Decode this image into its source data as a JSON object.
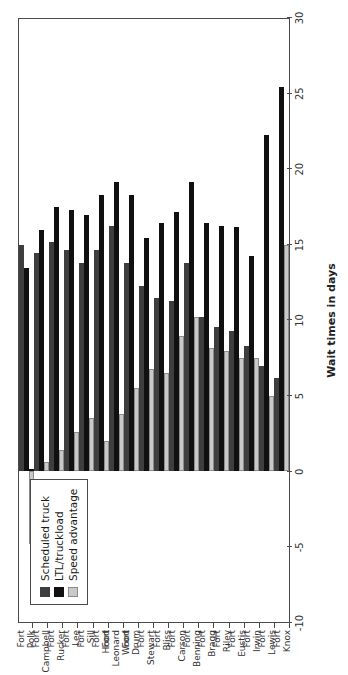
{
  "chart_data": {
    "type": "bar",
    "orientation": "horizontal-grouped",
    "title": "",
    "xlabel": "Wait times in days",
    "ylabel": "",
    "grid": false,
    "legend_position": "top-left-inside",
    "xlim": [
      -10,
      30
    ],
    "xticks": [
      -10,
      -5,
      0,
      5,
      10,
      15,
      20,
      25,
      30
    ],
    "xtick_labels": [
      "-10",
      "-5",
      "0",
      "5",
      "10",
      "15",
      "20",
      "25",
      "30"
    ],
    "categories": [
      "Fort\nKnox",
      "Fort\nLewis",
      "Fort\nIrwin",
      "Fort\nEustis",
      "Fort\nRiley",
      "Fort\nBragg",
      "Fort\nBenning",
      "Fort\nCarson",
      "Fort\nBliss",
      "Fort\nStewart",
      "Fort\nDrum",
      "Fort\nLeonard\nWood",
      "Fort\nHood",
      "Fort\nSill",
      "Fort\nLee",
      "Fort\nRucker",
      "Fort\nCampbell",
      "Fort\nPolk"
    ],
    "series": [
      {
        "name": "Scheduled truck",
        "color": "#3e3e3e",
        "values": [
          6.2,
          7.0,
          8.3,
          9.3,
          9.6,
          10.2,
          13.8,
          11.3,
          11.5,
          12.3,
          13.8,
          16.3,
          14.7,
          13.8,
          14.7,
          15.2,
          14.5,
          15.0
        ]
      },
      {
        "name": "LTL/truckload",
        "color": "#101010",
        "values": [
          25.5,
          22.3,
          14.3,
          16.2,
          16.3,
          16.5,
          19.2,
          17.2,
          16.5,
          15.5,
          18.3,
          19.2,
          18.3,
          17.0,
          17.3,
          17.5,
          16.0,
          13.5
        ]
      },
      {
        "name": "Speed advantage",
        "color": "#c9c9c9",
        "values": [
          15.0,
          5.0,
          7.5,
          7.5,
          8.0,
          8.2,
          10.2,
          9.0,
          6.5,
          6.8,
          5.5,
          3.8,
          2.0,
          3.5,
          2.6,
          1.4,
          0.6,
          -4.8
        ]
      }
    ]
  },
  "legend": {
    "items": [
      {
        "label": "Scheduled truck"
      },
      {
        "label": "LTL/truckload"
      },
      {
        "label": "Speed advantage"
      }
    ]
  },
  "axis": {
    "value_title": "Wait times in days"
  }
}
